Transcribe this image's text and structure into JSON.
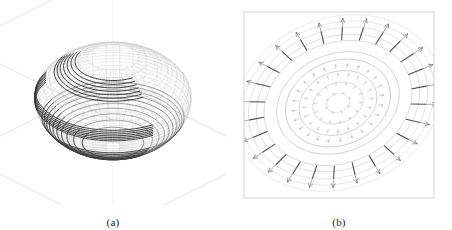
{
  "figure": {
    "background": "#ffffff",
    "width": 452,
    "height": 230,
    "ink_color": "#303030",
    "mesh_color": "#b9b9b9",
    "faint_color": "#d8d8d8",
    "box_color": "#c9c9c9"
  },
  "panels": [
    {
      "id": "panel-a",
      "caption": "(a)",
      "type": "3d-wireframe-surface",
      "description": "Three dimensional wireframe ovoid (egg shaped) surface rendered inside an axonometric bounding box",
      "box": {
        "visible": true,
        "style": "axonometric-cube-outline",
        "color": "#cccccc"
      },
      "surface": {
        "shape": "ovoid",
        "center_x": 113,
        "center_y": 100,
        "radius_x": 70,
        "radius_y": 78,
        "mesh_meridians": 36,
        "mesh_parallels": 28,
        "mesh_color": "#bdbdbd",
        "mesh_width": 0.35
      },
      "contour_bands": [
        {
          "name": "top-band",
          "latitude_start": 0.8,
          "latitude_end": 0.56,
          "count": 7,
          "color": "#2b2b2b",
          "width": 1.0
        },
        {
          "name": "equator-band",
          "latitude_start": 0.12,
          "latitude_end": -0.1,
          "count": 7,
          "color": "#303030",
          "width": 1.0
        },
        {
          "name": "bottom-band",
          "latitude_start": -0.42,
          "latitude_end": -0.92,
          "count": 10,
          "color": "#3a3a3a",
          "width": 0.8
        }
      ]
    },
    {
      "id": "panel-b",
      "caption": "(b)",
      "type": "polar-contour-vector-plot",
      "description": "Top-down elliptical contour map with radial vector arrows emanating outward",
      "frame": {
        "visible": true,
        "color": "#bfbfbf",
        "x": 18,
        "y": 12,
        "width": 190,
        "height": 186
      },
      "contours": {
        "center_x": 112,
        "center_y": 103,
        "rotation_deg": -22,
        "rings": [
          {
            "rx": 12,
            "ry": 9,
            "color": "#d0d0d0"
          },
          {
            "rx": 26,
            "ry": 20,
            "color": "#c6c6c6"
          },
          {
            "rx": 40,
            "ry": 31,
            "color": "#bdbdbd"
          },
          {
            "rx": 54,
            "ry": 42,
            "color": "#b6b6b6"
          },
          {
            "rx": 63,
            "ry": 49,
            "color": "#c0c0c0"
          },
          {
            "rx": 76,
            "ry": 60,
            "color": "#c8c8c8"
          },
          {
            "rx": 84,
            "ry": 66,
            "color": "#cfcfcf"
          },
          {
            "rx": 92,
            "ry": 73,
            "color": "#d6d6d6"
          },
          {
            "rx": 99,
            "ry": 79,
            "color": "#dcdcdc"
          },
          {
            "rx": 106,
            "ry": 85,
            "color": "#e2e2e2"
          }
        ]
      },
      "vectors": {
        "inner_rings": [
          {
            "radius_frac": 0.1,
            "count": 8,
            "length": 3.0,
            "color": "#c4c4c4",
            "width": 0.5
          },
          {
            "radius_frac": 0.2,
            "count": 14,
            "length": 3.6,
            "color": "#bcbcbc",
            "width": 0.5
          },
          {
            "radius_frac": 0.3,
            "count": 20,
            "length": 4.2,
            "color": "#b4b4b4",
            "width": 0.55
          },
          {
            "radius_frac": 0.4,
            "count": 24,
            "length": 4.8,
            "color": "#ababab",
            "width": 0.6
          }
        ],
        "outer_ring": {
          "radius_frac": 0.72,
          "count": 26,
          "length": 26,
          "color": "#2e2e2e",
          "width": 1.1,
          "arrowhead": true
        }
      }
    }
  ]
}
